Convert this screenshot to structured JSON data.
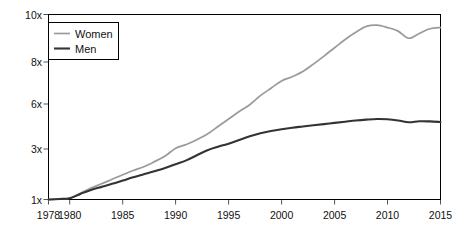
{
  "chart_data": {
    "type": "line",
    "title": "",
    "subtitle": "",
    "xlabel": "",
    "ylabel": "",
    "grid": false,
    "legend_position": "top-left",
    "x": [
      1978,
      1979,
      1980,
      1981,
      1982,
      1983,
      1984,
      1985,
      1986,
      1987,
      1988,
      1989,
      1990,
      1991,
      1992,
      1993,
      1994,
      1995,
      1996,
      1997,
      1998,
      1999,
      2000,
      2001,
      2002,
      2003,
      2004,
      2005,
      2006,
      2007,
      2008,
      2009,
      2010,
      2011,
      2012,
      2013,
      2014,
      2015
    ],
    "x_tick_labels": [
      "1978",
      "1980",
      "1985",
      "1990",
      "1995",
      "2000",
      "2005",
      "2010",
      "2015"
    ],
    "x_tick_values": [
      1978,
      1980,
      1985,
      1990,
      1995,
      2000,
      2005,
      2010,
      2015
    ],
    "xlim": [
      1978,
      2015
    ],
    "y_tick_labels": [
      "1x",
      "3x",
      "6x",
      "8x",
      "10x"
    ],
    "y_tick_values": [
      1,
      3,
      6,
      8,
      10
    ],
    "ylim": [
      1,
      10
    ],
    "series": [
      {
        "name": "Women",
        "color": "#9a9a9a",
        "values": [
          1.0,
          1.02,
          1.05,
          1.25,
          1.45,
          1.62,
          1.8,
          1.98,
          2.15,
          2.3,
          2.5,
          2.72,
          3.05,
          3.3,
          3.62,
          4.0,
          4.5,
          5.0,
          5.5,
          5.95,
          6.4,
          6.75,
          7.1,
          7.3,
          7.55,
          7.9,
          8.25,
          8.6,
          8.95,
          9.25,
          9.5,
          9.55,
          9.45,
          9.3,
          9.0,
          9.2,
          9.4,
          9.45
        ]
      },
      {
        "name": "Men",
        "color": "#333333",
        "values": [
          1.0,
          1.02,
          1.05,
          1.22,
          1.38,
          1.5,
          1.62,
          1.75,
          1.88,
          2.0,
          2.12,
          2.25,
          2.4,
          2.55,
          2.75,
          2.95,
          3.15,
          3.35,
          3.6,
          3.85,
          4.05,
          4.2,
          4.32,
          4.42,
          4.5,
          4.58,
          4.66,
          4.74,
          4.82,
          4.9,
          4.96,
          5.0,
          4.98,
          4.9,
          4.78,
          4.85,
          4.84,
          4.8
        ]
      }
    ]
  },
  "legend": {
    "entries": [
      {
        "label": "Women"
      },
      {
        "label": "Men"
      }
    ]
  },
  "axes": {
    "border_color": "#000000",
    "tick_color": "#555555"
  }
}
